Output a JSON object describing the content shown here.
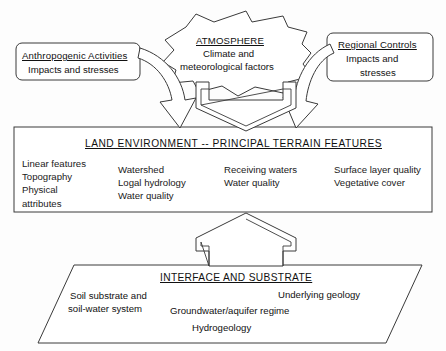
{
  "diagram": {
    "background_color": "#fdfdfd",
    "stroke_color": "#3a3a3a"
  },
  "anthropogenic_box": {
    "name": "Anthropogenic Activities",
    "title": "Anthropogenic Activities",
    "line1": "Impacts and stresses"
  },
  "atmosphere_cloud": {
    "title": "ATMOSPHERE",
    "line1": "Climate and",
    "line2": "meteorological factors"
  },
  "regional_box": {
    "title": "Regional Controls",
    "line1": "Impacts and",
    "line2": "stresses"
  },
  "land_band": {
    "title": "LAND ENVIRONMENT -- PRINCIPAL TERRAIN FEATURES",
    "columns": [
      {
        "name": "column-1",
        "items": [
          "Linear features",
          "Topography",
          "Physical",
          "attributes"
        ]
      },
      {
        "name": "column-2",
        "items": [
          "Watershed",
          "Logal hydrology",
          "Water quality"
        ]
      },
      {
        "name": "column-3",
        "items": [
          "Receiving waters",
          "Water quality"
        ]
      },
      {
        "name": "column-4",
        "items": [
          "Surface layer quality",
          "Vegetative cover"
        ]
      }
    ]
  },
  "interface_parallelogram": {
    "title": "INTERFACE AND SUBSTRATE",
    "item_left_line1": "Soil substrate and",
    "item_left_line2": "soil-water system",
    "item_right": "Underlying geology",
    "item_mid": "Groundwater/aquifer regime",
    "item_bottom": "Hydrogeology"
  },
  "arrows": {
    "left_curved": "curved-arrow-down-right",
    "right_curved": "curved-arrow-down-left",
    "atmosphere_down": "block-arrow-down",
    "substrate_up": "block-arrow-up"
  }
}
